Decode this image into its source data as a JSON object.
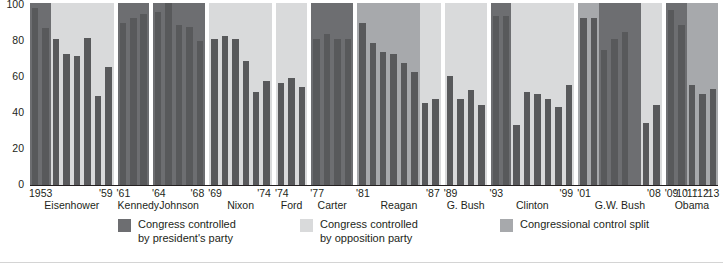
{
  "chart_data": {
    "type": "bar",
    "title": "",
    "xlabel": "",
    "ylabel": "",
    "ylim": [
      0,
      100
    ],
    "ytick_labels": [
      "100",
      "80",
      "60",
      "40",
      "20",
      "0"
    ],
    "ytick_values": [
      100,
      80,
      60,
      40,
      20,
      0
    ],
    "grid": false,
    "legend_position": "bottom",
    "x_tick_labels": [
      "1953",
      "'59",
      "'61",
      "'64",
      "'68",
      "'69",
      "'74",
      "'74",
      "'77",
      "'81",
      "'87",
      "'89",
      "'93",
      "'99",
      "'01",
      "'08",
      "'09",
      "'10",
      "'11",
      "'12",
      "'13"
    ],
    "series_name": "Percent",
    "legend": [
      {
        "label": "Congress controlled\nby president's party",
        "color": "#6d6e71",
        "key": "president-party"
      },
      {
        "label": "Congress controlled\nby opposition party",
        "color": "#d9dadb",
        "key": "opposition-party"
      },
      {
        "label": "Congressional control split",
        "color": "#a7a9ac",
        "key": "control-split"
      }
    ],
    "bar_color": "#58595b",
    "terms": [
      {
        "president": "Eisenhower",
        "start_label": "1953",
        "end_label": "'59",
        "bars": [
          97,
          86,
          80,
          72,
          71,
          81,
          49,
          65
        ],
        "bands": [
          {
            "control": "president-party",
            "span": 2
          },
          {
            "control": "opposition-party",
            "span": 6
          }
        ]
      },
      {
        "president": "Kennedy",
        "start_label": "'61",
        "end_label": "",
        "bars": [
          89,
          92,
          94
        ],
        "bands": [
          {
            "control": "president-party",
            "span": 3
          }
        ]
      },
      {
        "president": "Johnson",
        "start_label": "'64",
        "end_label": "'68",
        "bars": [
          95,
          100,
          88,
          87,
          79
        ],
        "bands": [
          {
            "control": "president-party",
            "span": 5
          }
        ]
      },
      {
        "president": "Nixon",
        "start_label": "'69",
        "end_label": "'74",
        "bars": [
          80,
          82,
          80,
          68,
          51,
          57
        ],
        "bands": [
          {
            "control": "opposition-party",
            "span": 6
          }
        ]
      },
      {
        "president": "Ford",
        "start_label": "'74",
        "end_label": "",
        "bars": [
          56,
          59,
          54
        ],
        "bands": [
          {
            "control": "opposition-party",
            "span": 3
          }
        ]
      },
      {
        "president": "Carter",
        "start_label": "'77",
        "end_label": "",
        "bars": [
          80,
          83,
          80,
          80
        ],
        "bands": [
          {
            "control": "president-party",
            "span": 4
          }
        ]
      },
      {
        "president": "Reagan",
        "start_label": "'81",
        "end_label": "'87",
        "bars": [
          89,
          78,
          73,
          72,
          67,
          62,
          45,
          47
        ],
        "bands": [
          {
            "control": "control-split",
            "span": 6
          },
          {
            "control": "opposition-party",
            "span": 2
          }
        ]
      },
      {
        "president": "G. Bush",
        "start_label": "'89",
        "end_label": "",
        "bars": [
          60,
          47,
          52,
          44
        ],
        "bands": [
          {
            "control": "opposition-party",
            "span": 4
          }
        ]
      },
      {
        "president": "Clinton",
        "start_label": "'93",
        "end_label": "'99",
        "bars": [
          93,
          93,
          33,
          51,
          50,
          47,
          43,
          55
        ],
        "bands": [
          {
            "control": "president-party",
            "span": 2
          },
          {
            "control": "opposition-party",
            "span": 6
          }
        ]
      },
      {
        "president": "G.W. Bush",
        "start_label": "'01",
        "end_label": "'08",
        "bars": [
          92,
          92,
          74,
          80,
          84,
          0,
          34,
          44
        ],
        "bands": [
          {
            "control": "control-split",
            "span": 2
          },
          {
            "control": "president-party",
            "span": 4
          },
          {
            "control": "opposition-party",
            "span": 2
          }
        ]
      },
      {
        "president": "Obama",
        "start_label": "'09",
        "mid_labels": [
          "'10",
          "'11",
          "'12",
          "'13"
        ],
        "bars": [
          96,
          88,
          55,
          50,
          53
        ],
        "bands": [
          {
            "control": "president-party",
            "span": 2
          },
          {
            "control": "control-split",
            "span": 3
          }
        ]
      }
    ]
  }
}
